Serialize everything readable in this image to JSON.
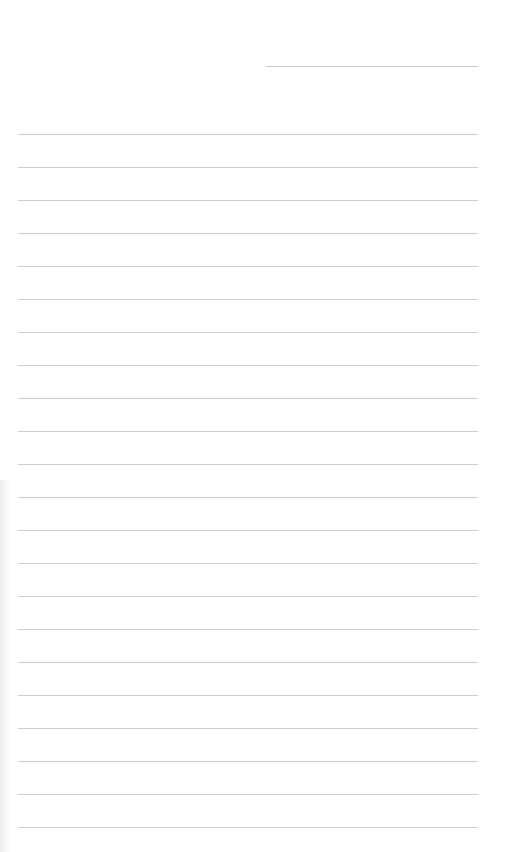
{
  "page": {
    "type": "blank-lined-paper",
    "background": "#ffffff",
    "line_color": "#cdcdcd"
  },
  "header": {
    "date_line": {
      "x": 266,
      "y": 66,
      "width": 212,
      "value": ""
    }
  },
  "ruled_lines": {
    "start_x": 18,
    "width": 460,
    "first_y": 134,
    "spacing": 33,
    "count": 22,
    "values": [
      "",
      "",
      "",
      "",
      "",
      "",
      "",
      "",
      "",
      "",
      "",
      "",
      "",
      "",
      "",
      "",
      "",
      "",
      "",
      "",
      "",
      ""
    ]
  }
}
